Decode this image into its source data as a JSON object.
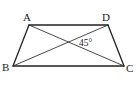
{
  "figure": {
    "type": "trapezoid-with-diagonals",
    "vertices": {
      "A": {
        "label": "A",
        "x": 29,
        "y": 25
      },
      "D": {
        "label": "D",
        "x": 108,
        "y": 25
      },
      "B": {
        "label": "B",
        "x": 13,
        "y": 66
      },
      "C": {
        "label": "C",
        "x": 124,
        "y": 66
      }
    },
    "sides": [
      "AD",
      "DC",
      "CB",
      "BA"
    ],
    "diagonals": [
      "AC",
      "BD"
    ],
    "angle_annotation": {
      "text": "45°",
      "location": "between diagonals at intersection, right side"
    }
  },
  "labels": {
    "A": "A",
    "B": "B",
    "C": "C",
    "D": "D",
    "angle": "45°"
  }
}
